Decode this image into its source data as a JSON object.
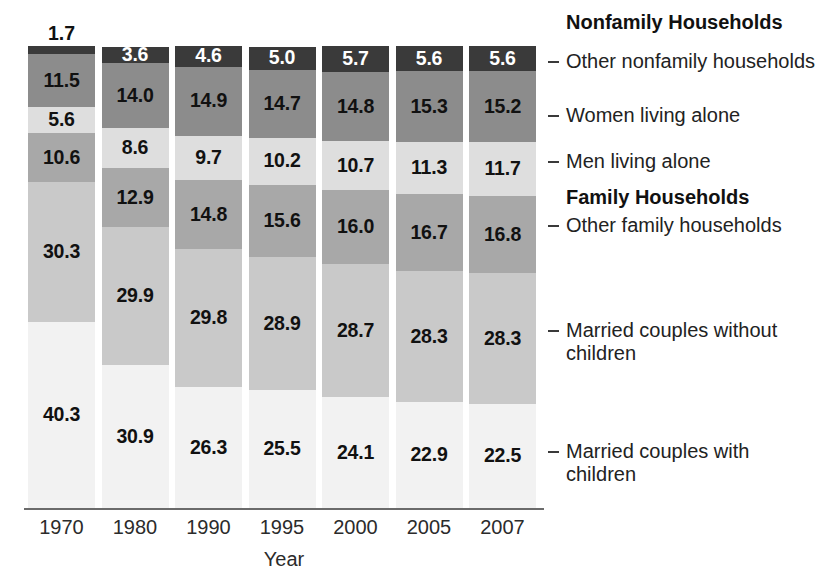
{
  "chart_data": {
    "type": "bar",
    "stacked": true,
    "orientation": "vertical",
    "title": "",
    "xlabel": "Year",
    "ylabel": "",
    "ylim": [
      0,
      100
    ],
    "grid": false,
    "legend_position": "right",
    "categories": [
      "1970",
      "1980",
      "1990",
      "1995",
      "2000",
      "2005",
      "2007"
    ],
    "series": [
      {
        "name": "Married couples with children",
        "group": "Family Households",
        "color": "#f2f2f2",
        "label_color": "#111111",
        "values": [
          40.3,
          30.9,
          26.3,
          25.5,
          24.1,
          22.9,
          22.5
        ]
      },
      {
        "name": "Married couples without children",
        "group": "Family Households",
        "color": "#c9c9c9",
        "label_color": "#111111",
        "values": [
          30.3,
          29.9,
          29.8,
          28.9,
          28.7,
          28.3,
          28.3
        ]
      },
      {
        "name": "Other family households",
        "group": "Family Households",
        "color": "#a8a8a8",
        "label_color": "#111111",
        "values": [
          10.6,
          12.9,
          14.8,
          15.6,
          16.0,
          16.7,
          16.8
        ]
      },
      {
        "name": "Men living alone",
        "group": "Nonfamily Households",
        "color": "#dedede",
        "label_color": "#111111",
        "values": [
          5.6,
          8.6,
          9.7,
          10.2,
          10.7,
          11.3,
          11.7
        ]
      },
      {
        "name": "Women living alone",
        "group": "Nonfamily Households",
        "color": "#8c8c8c",
        "label_color": "#111111",
        "values": [
          11.5,
          14.0,
          14.9,
          14.7,
          14.8,
          15.3,
          15.2
        ]
      },
      {
        "name": "Other nonfamily households",
        "group": "Nonfamily Households",
        "color": "#3a3a3a",
        "label_color": "#ffffff",
        "values": [
          1.7,
          3.6,
          4.6,
          5.0,
          5.7,
          5.6,
          5.6
        ]
      }
    ],
    "annotations": {
      "outside_labels": [
        {
          "category": "1970",
          "series": "Other nonfamily households",
          "value": 1.7
        }
      ]
    }
  },
  "axis": {
    "ticks": [
      "1970",
      "1980",
      "1990",
      "1995",
      "2000",
      "2005",
      "2007"
    ],
    "title": "Year"
  },
  "legend": {
    "groups": [
      {
        "label": "Nonfamily Households"
      },
      {
        "label": "Family Households"
      }
    ],
    "entries": [
      {
        "label": "Other nonfamily households"
      },
      {
        "label": "Women living alone"
      },
      {
        "label": "Men living alone"
      },
      {
        "label": "Other family households"
      },
      {
        "label": "Married couples without children"
      },
      {
        "label": "Married couples with children"
      }
    ]
  },
  "values": {
    "1970": {
      "s0": "40.3",
      "s1": "30.3",
      "s2": "10.6",
      "s3": "5.6",
      "s4": "11.5",
      "s5": "1.7"
    },
    "1980": {
      "s0": "30.9",
      "s1": "29.9",
      "s2": "12.9",
      "s3": "8.6",
      "s4": "14.0",
      "s5": "3.6"
    },
    "1990": {
      "s0": "26.3",
      "s1": "29.8",
      "s2": "14.8",
      "s3": "9.7",
      "s4": "14.9",
      "s5": "4.6"
    },
    "1995": {
      "s0": "25.5",
      "s1": "28.9",
      "s2": "15.6",
      "s3": "10.2",
      "s4": "14.7",
      "s5": "5.0"
    },
    "2000": {
      "s0": "24.1",
      "s1": "28.7",
      "s2": "16.0",
      "s3": "10.7",
      "s4": "14.8",
      "s5": "5.7"
    },
    "2005": {
      "s0": "22.9",
      "s1": "28.3",
      "s2": "16.7",
      "s3": "11.3",
      "s4": "15.3",
      "s5": "5.6"
    },
    "2007": {
      "s0": "22.5",
      "s1": "28.3",
      "s2": "16.8",
      "s3": "11.7",
      "s4": "15.2",
      "s5": "5.6"
    }
  }
}
